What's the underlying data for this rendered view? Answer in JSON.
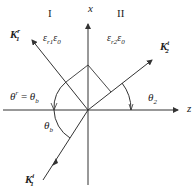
{
  "diagram": {
    "regions": {
      "region1": "I",
      "region2": "II"
    },
    "axes": {
      "x_label": "x",
      "z_label": "z"
    },
    "media": {
      "medium1": {
        "eps": "ε",
        "sub1": "r1",
        "eps0": "ε",
        "sub0": "0"
      },
      "medium2": {
        "eps": "ε",
        "sub1": "r2",
        "eps0": "ε",
        "sub0": "0"
      }
    },
    "vectors": {
      "reflected": {
        "symbol": "K",
        "sub": "1",
        "sup": "r"
      },
      "transmitted": {
        "symbol": "K",
        "sub": "2",
        "sup": "t"
      },
      "incident": {
        "symbol": "K",
        "sub": "1",
        "sup": "i"
      }
    },
    "angles": {
      "reflection_eq": {
        "lhs": "θ",
        "lhs_sup": "r",
        "eq": " = ",
        "rhs": "θ",
        "rhs_sub": "b"
      },
      "incidence": {
        "sym": "θ",
        "sub": "b"
      },
      "transmission": {
        "sym": "θ",
        "sub": "2"
      }
    },
    "colors": {
      "line": "#333333",
      "text": "#222222"
    }
  }
}
